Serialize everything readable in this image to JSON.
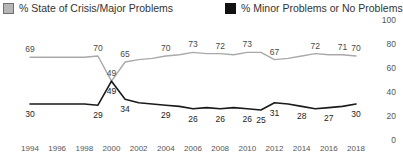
{
  "legend": {
    "entries": [
      {
        "label": "% State of Crisis/Major Problems",
        "swatch": "gray-swatch-icon",
        "color": "#b6b6b6"
      },
      {
        "label": "% Minor Problems or No Problems",
        "swatch": "black-swatch-icon",
        "color": "#111111"
      }
    ]
  },
  "chart_data": {
    "type": "line",
    "title": "",
    "subtitle": "",
    "xlabel": "",
    "ylabel": "",
    "ylim": [
      0,
      100
    ],
    "yticks": [
      0,
      20,
      40,
      60,
      80,
      100
    ],
    "grid": false,
    "legend_position": "top",
    "x": [
      1994,
      1995,
      1996,
      1997,
      1998,
      1999,
      2000,
      2001,
      2002,
      2003,
      2004,
      2005,
      2006,
      2007,
      2008,
      2009,
      2010,
      2011,
      2012,
      2013,
      2014,
      2015,
      2016,
      2017,
      2018
    ],
    "xticks": [
      1994,
      1996,
      1998,
      2000,
      2002,
      2004,
      2006,
      2008,
      2010,
      2012,
      2014,
      2016,
      2018
    ],
    "series": [
      {
        "name": "% State of Crisis/Major Problems",
        "color": "#a9a9a9",
        "values": [
          69,
          69,
          69,
          69,
          69,
          70,
          49,
          65,
          67,
          68,
          70,
          71,
          73,
          72,
          72,
          71,
          73,
          73,
          67,
          68,
          70,
          72,
          71,
          71,
          70
        ],
        "labeled_points": [
          {
            "x": 1994,
            "value": 69
          },
          {
            "x": 1999,
            "value": 70
          },
          {
            "x": 2000,
            "value": 49
          },
          {
            "x": 2001,
            "value": 65
          },
          {
            "x": 2004,
            "value": 70
          },
          {
            "x": 2006,
            "value": 73
          },
          {
            "x": 2008,
            "value": 72
          },
          {
            "x": 2010,
            "value": 73
          },
          {
            "x": 2012,
            "value": 67
          },
          {
            "x": 2015,
            "value": 72
          },
          {
            "x": 2017,
            "value": 71
          },
          {
            "x": 2018,
            "value": 70
          }
        ]
      },
      {
        "name": "% Minor Problems or No Problems",
        "color": "#1a1a1a",
        "values": [
          30,
          30,
          30,
          30,
          30,
          29,
          49,
          34,
          31,
          30,
          29,
          28,
          26,
          27,
          26,
          27,
          26,
          25,
          31,
          30,
          28,
          26,
          27,
          28,
          30
        ],
        "labeled_points": [
          {
            "x": 1994,
            "value": 30
          },
          {
            "x": 1999,
            "value": 29
          },
          {
            "x": 2000,
            "value": 49
          },
          {
            "x": 2001,
            "value": 34
          },
          {
            "x": 2004,
            "value": 29
          },
          {
            "x": 2006,
            "value": 26
          },
          {
            "x": 2008,
            "value": 26
          },
          {
            "x": 2010,
            "value": 26
          },
          {
            "x": 2011,
            "value": 25
          },
          {
            "x": 2012,
            "value": 31
          },
          {
            "x": 2014,
            "value": 28
          },
          {
            "x": 2016,
            "value": 27
          },
          {
            "x": 2018,
            "value": 30
          }
        ]
      }
    ]
  }
}
